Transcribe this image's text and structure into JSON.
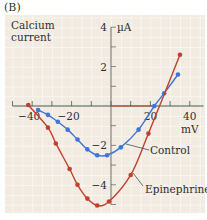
{
  "figure": {
    "panel_label": "(B)",
    "y_title_line1": "Calcium",
    "y_title_line2": "current",
    "y_unit": "µA",
    "x_unit": "mV"
  },
  "colors": {
    "background": "#f1ebe1",
    "grid": "#fbf8f3",
    "axis": "#3f5a48",
    "control": "#3f74d8",
    "epinephrine": "#c2402e",
    "text": "#2f2f2f"
  },
  "chart_data": {
    "type": "line",
    "title": "",
    "xlabel": "mV",
    "ylabel": "Calcium current (µA)",
    "xlim": [
      -50,
      47
    ],
    "ylim": [
      -5.3,
      4.6
    ],
    "x_ticks": [
      -50,
      -40,
      -30,
      -20,
      -10,
      0,
      10,
      20,
      30,
      40
    ],
    "x_tick_labels": [
      {
        "value": -40,
        "label": "-40"
      },
      {
        "value": -20,
        "label": "-20"
      },
      {
        "value": 20,
        "label": "20"
      },
      {
        "value": 40,
        "label": "40"
      }
    ],
    "y_ticks": [
      4,
      3,
      2,
      1,
      -1,
      -2,
      -3,
      -4,
      -5
    ],
    "y_tick_labels": [
      {
        "value": 4,
        "label": "4"
      },
      {
        "value": 2,
        "label": "2"
      },
      {
        "value": -2,
        "label": "-2"
      },
      {
        "value": -4,
        "label": "-4"
      }
    ],
    "grid": true,
    "legend": "inline annotations with leader lines",
    "series": [
      {
        "name": "Control",
        "color": "#3f74d8",
        "x": [
          -37,
          -32,
          -27,
          -22,
          -17,
          -12,
          -7,
          -2,
          5,
          14,
          22,
          27,
          34
        ],
        "y": [
          -0.2,
          -0.45,
          -0.8,
          -1.2,
          -1.7,
          -2.2,
          -2.5,
          -2.5,
          -2.1,
          -1.2,
          0.0,
          0.65,
          1.6
        ]
      },
      {
        "name": "Epinephrine",
        "color": "#c2402e",
        "x": [
          -42,
          -32,
          -28,
          -21,
          -17,
          -12,
          -7,
          -1,
          10,
          19,
          35
        ],
        "y": [
          0.05,
          -1.1,
          -1.9,
          -3.2,
          -4.0,
          -4.7,
          -5.05,
          -4.85,
          -3.5,
          -1.4,
          2.6
        ]
      }
    ],
    "annotations": [
      {
        "text": "Control",
        "x_px": 150,
        "y_px": 154,
        "leader_from": [
          149,
          150
        ],
        "leader_to": [
          126,
          144
        ]
      },
      {
        "text": "Epinephrine",
        "x_px": 145,
        "y_px": 193,
        "leader_from": [
          143,
          186
        ],
        "leader_to": [
          133,
          173
        ]
      }
    ]
  }
}
